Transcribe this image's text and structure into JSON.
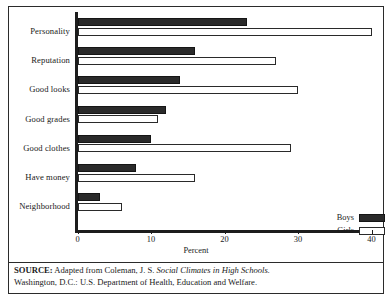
{
  "chart_data": {
    "type": "bar",
    "orientation": "horizontal",
    "title": "",
    "xlabel": "Percent",
    "ylabel": "",
    "xlim": [
      0,
      40
    ],
    "xticks": [
      0,
      10,
      20,
      30,
      40
    ],
    "xtick_labels": [
      "0",
      "10",
      "20",
      "30",
      "40"
    ],
    "grid": false,
    "legend_position": "bottom-right",
    "categories": [
      "Personality",
      "Reputation",
      "Good looks",
      "Good grades",
      "Good clothes",
      "Have money",
      "Neighborhood"
    ],
    "series": [
      {
        "name": "Boys",
        "color": "#2a2a2a",
        "values": [
          23,
          16,
          14,
          12,
          10,
          8,
          3
        ]
      },
      {
        "name": "Girls",
        "color": "#ffffff",
        "values": [
          40,
          27,
          30,
          11,
          29,
          16,
          6
        ]
      }
    ]
  },
  "legend": {
    "items": [
      {
        "label": "Boys"
      },
      {
        "label": "Girls"
      }
    ]
  },
  "source": {
    "prefix": "SOURCE:",
    "line1_before_italic": " Adapted from Coleman, J. S. ",
    "line1_italic": "Social Climates in High Schools.",
    "line2": "Washington, D.C.: U.S. Department of Health, Education and Welfare."
  }
}
